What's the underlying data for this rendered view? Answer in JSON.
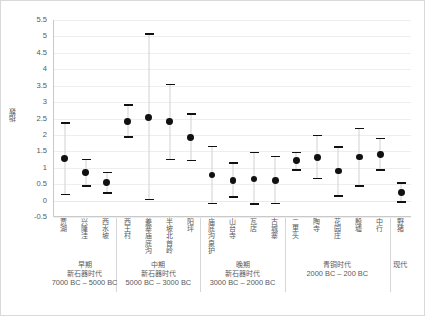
{
  "chart_data": {
    "type": "scatter",
    "title": "",
    "xlabel": "",
    "ylabel": "指数",
    "ylim": [
      -0.5,
      5.5
    ],
    "ytick_step": 0.5,
    "yticks": [
      "5.5",
      "5",
      "4.5",
      "4",
      "3.5",
      "3",
      "2.5",
      "2",
      "1.5",
      "1",
      "0.5",
      "0",
      "-0.5"
    ],
    "grid": true,
    "legend": "none",
    "error_bars": "range (low / high caps)",
    "categories": [
      "贾湖",
      "兴隆洼",
      "西水坡",
      "西王村",
      "姜寨庙底沟",
      "半坡(北首岭)",
      "阳坪(姜寨)",
      "庙底沟(泉护)",
      "山台寺",
      "瓦店",
      "古城寨",
      "二里头",
      "陶寺",
      "新砦",
      "花园庄",
      "殷墟(中行)",
      "现代"
    ],
    "points": [
      {
        "label": "贾湖",
        "mean": 1.28,
        "low": 0.18,
        "high": 2.37
      },
      {
        "label": "兴隆洼",
        "mean": 0.86,
        "low": 0.45,
        "high": 1.25
      },
      {
        "label": "西水坡",
        "mean": 0.54,
        "low": 0.23,
        "high": 0.85
      },
      {
        "label": "西王村",
        "mean": 2.42,
        "low": 1.93,
        "high": 2.92
      },
      {
        "label": "姜寨庙底沟",
        "mean": 2.53,
        "low": 0.03,
        "high": 5.07
      },
      {
        "label": "半坡北首岭",
        "mean": 2.4,
        "low": 1.25,
        "high": 3.53
      },
      {
        "label": "阳坪",
        "mean": 1.93,
        "low": 1.22,
        "high": 2.63
      },
      {
        "label": "庙底沟泉护",
        "mean": 0.78,
        "low": -0.09,
        "high": 1.65
      },
      {
        "label": "山台寺",
        "mean": 0.61,
        "low": 0.11,
        "high": 1.14
      },
      {
        "label": "瓦店",
        "mean": 0.66,
        "low": -0.1,
        "high": 1.46
      },
      {
        "label": "古城寨",
        "mean": 0.61,
        "low": -0.09,
        "high": 1.34
      },
      {
        "label": "二里头",
        "mean": 1.21,
        "low": 0.94,
        "high": 1.47
      },
      {
        "label": "陶寺",
        "mean": 1.31,
        "low": 0.67,
        "high": 1.98
      },
      {
        "label": "花园庄",
        "mean": 0.9,
        "low": 0.14,
        "high": 1.63
      },
      {
        "label": "殷墟",
        "mean": 1.33,
        "low": 0.45,
        "high": 2.2
      },
      {
        "label": "中行",
        "mean": 1.4,
        "low": 0.94,
        "high": 1.89
      },
      {
        "label": "野猪",
        "mean": 0.25,
        "low": -0.04,
        "high": 0.54
      }
    ],
    "periods": [
      {
        "line1": "早期",
        "line2": "新石器时代",
        "line3": "7000 BC – 5000 BC",
        "start": 0,
        "end": 2
      },
      {
        "line1": "中期",
        "line2": "新石器时代",
        "line3": "5000 BC – 3000 BC",
        "start": 3,
        "end": 6
      },
      {
        "line1": "晚期",
        "line2": "新石器时代",
        "line3": "3000 BC – 2000 BC",
        "start": 7,
        "end": 10
      },
      {
        "line1": "",
        "line2": "青铜时代",
        "line3": "2000 BC – 200 BC",
        "start": 11,
        "end": 15
      },
      {
        "line1": "",
        "line2": "",
        "line3": "现代",
        "start": 16,
        "end": 16
      }
    ]
  },
  "axis": {
    "y_title": "指数"
  }
}
